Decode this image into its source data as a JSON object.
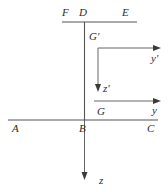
{
  "figure": {
    "background_color": "#ffffff",
    "line_color": "#555555",
    "text_color": "#2b2b2b"
  },
  "labels": {
    "F": "F",
    "D": "D",
    "E": "E",
    "G_prime": "G'",
    "y_prime": "y'",
    "z_prime": "z'",
    "G": "G",
    "y": "y",
    "A": "A",
    "B": "B",
    "C": "C",
    "z": "z"
  },
  "geometry": {
    "top_flange": {
      "name": "F-D-E",
      "y": 22,
      "x_start": 62,
      "x_end": 137
    },
    "web": {
      "name": "B-D",
      "x": 84.5,
      "y_top": 22,
      "y_bottom": 120
    },
    "bottom_flange": {
      "name": "A-B-C",
      "y": 120,
      "x_start": 8,
      "x_end": 158
    },
    "axis_y_prime": {
      "origin_x": 98,
      "origin_y": 48,
      "tip_x": 160,
      "tip_y": 48
    },
    "axis_z_prime": {
      "origin_x": 98,
      "origin_y": 48,
      "tip_x": 98,
      "tip_y": 92
    },
    "axis_y": {
      "origin_x": 94,
      "origin_y": 101,
      "tip_x": 160,
      "tip_y": 101
    },
    "axis_z": {
      "origin_x": 84.5,
      "origin_y": 120,
      "tip_x": 84.5,
      "tip_y": 180
    }
  }
}
